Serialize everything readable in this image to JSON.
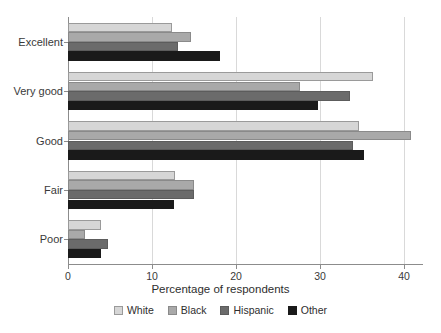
{
  "chart_data": {
    "type": "bar",
    "orientation": "horizontal",
    "title": "",
    "xlabel": "Percentage of respondents",
    "ylabel": "",
    "xlim": [
      0,
      42.3
    ],
    "xticks": [
      0,
      10,
      20,
      30,
      40
    ],
    "xtick_labels": [
      "0",
      "10",
      "20",
      "30",
      "40"
    ],
    "grid": "vertical",
    "legend_position": "bottom-center",
    "categories": [
      "Excellent",
      "Very good",
      "Good",
      "Fair",
      "Poor"
    ],
    "series": [
      {
        "name": "White",
        "color": "#d6d6d6",
        "values": [
          12.4,
          36.3,
          34.7,
          12.7,
          3.9
        ]
      },
      {
        "name": "Black",
        "color": "#a9a9a9",
        "values": [
          14.6,
          27.6,
          40.8,
          15.0,
          2.0
        ]
      },
      {
        "name": "Hispanic",
        "color": "#6b6b6b",
        "values": [
          13.1,
          33.6,
          33.9,
          15.0,
          4.8
        ]
      },
      {
        "name": "Other",
        "color": "#1a1a1a",
        "values": [
          18.1,
          29.8,
          35.2,
          12.6,
          3.9
        ]
      }
    ]
  }
}
